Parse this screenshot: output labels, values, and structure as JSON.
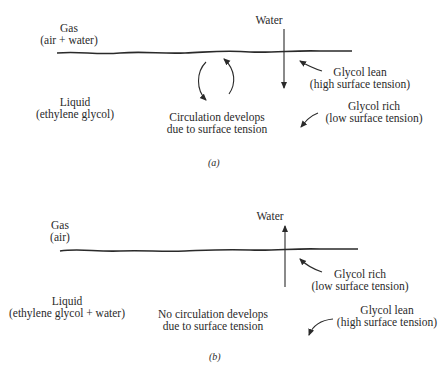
{
  "panels": [
    {
      "id": "a",
      "caption": "(a)",
      "gas": {
        "title": "Gas",
        "subtitle": "(air + water)"
      },
      "liquid": {
        "title": "Liquid",
        "subtitle": "(ethylene glycol)"
      },
      "water_label": "Water",
      "water_direction": "down",
      "circulation": {
        "line1": "Circulation develops",
        "line2": "due to surface tension"
      },
      "near_surface": {
        "line1": "Glycol lean",
        "line2": "(high surface tension)"
      },
      "bulk": {
        "line1": "Glycol rich",
        "line2": "(low surface tension)"
      }
    },
    {
      "id": "b",
      "caption": "(b)",
      "gas": {
        "title": "Gas",
        "subtitle": "(air)"
      },
      "liquid": {
        "title": "Liquid",
        "subtitle": "(ethylene glycol + water)"
      },
      "water_label": "Water",
      "water_direction": "up",
      "circulation": {
        "line1": "No circulation develops",
        "line2": "due to surface tension"
      },
      "near_surface": {
        "line1": "Glycol rich",
        "line2": "(low surface tension)"
      },
      "bulk": {
        "line1": "Glycol lean",
        "line2": "(high surface tension)"
      }
    }
  ],
  "colors": {
    "ink": "#2a2a2a",
    "background": "#ffffff"
  }
}
